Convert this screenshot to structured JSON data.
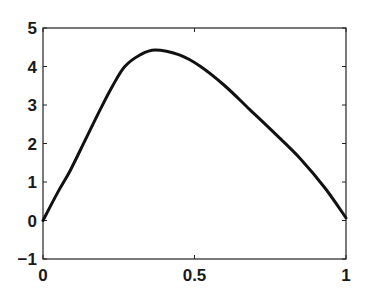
{
  "chart_data": {
    "type": "line",
    "title": "",
    "xlabel": "",
    "ylabel": "",
    "xlim": [
      0,
      1
    ],
    "ylim": [
      -1,
      5
    ],
    "grid": false,
    "legend": null,
    "x_ticks": [
      "0",
      "0.5",
      "1"
    ],
    "y_ticks": [
      "-1",
      "0",
      "1",
      "2",
      "3",
      "4",
      "5"
    ],
    "series": [
      {
        "name": "curve",
        "color": "#111111",
        "x": [
          0,
          0.05,
          0.09,
          0.14,
          0.19,
          0.23,
          0.27,
          0.32,
          0.37,
          0.45,
          0.52,
          0.6,
          0.68,
          0.76,
          0.85,
          0.93,
          1.0
        ],
        "y": [
          0,
          0.75,
          1.3,
          2.1,
          2.9,
          3.5,
          4.0,
          4.3,
          4.43,
          4.3,
          4.0,
          3.5,
          2.9,
          2.3,
          1.6,
          0.85,
          0.07
        ]
      }
    ]
  },
  "axes": {
    "x_tick_labels": [
      "0",
      "0.5",
      "1"
    ],
    "y_tick_labels": [
      "5",
      "4",
      "3",
      "2",
      "1",
      "0",
      "-1"
    ]
  }
}
